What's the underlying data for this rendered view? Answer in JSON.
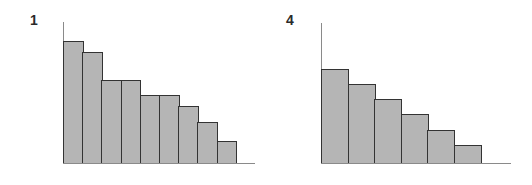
{
  "chart_data": [
    {
      "type": "bar",
      "title": "1",
      "categories": [
        "1",
        "2",
        "3",
        "4",
        "5",
        "6",
        "7",
        "8",
        "9"
      ],
      "values": [
        122,
        111,
        83,
        83,
        68,
        68,
        57,
        41,
        22
      ],
      "xlabel": "",
      "ylabel": "",
      "ylim": [
        0,
        141
      ],
      "grid": false,
      "legend": null,
      "bar_color": "#b5b5b5",
      "edge_color": "#333333"
    },
    {
      "type": "bar",
      "title": "4",
      "categories": [
        "1",
        "2",
        "3",
        "4",
        "5",
        "6"
      ],
      "values": [
        94,
        79,
        64,
        49,
        33,
        18
      ],
      "xlabel": "",
      "ylabel": "",
      "ylim": [
        0,
        140
      ],
      "grid": false,
      "legend": null,
      "bar_color": "#b5b5b5",
      "edge_color": "#333333"
    }
  ],
  "panels": [
    {
      "label": "1"
    },
    {
      "label": "4"
    }
  ]
}
